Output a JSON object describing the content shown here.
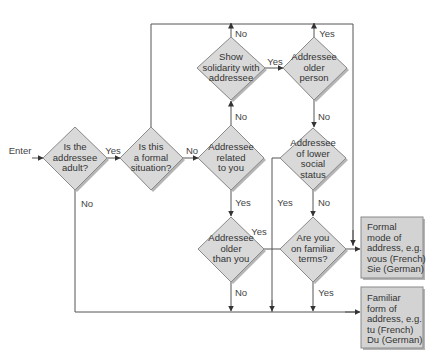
{
  "colors": {
    "diamond_fill": "#d9d9d9",
    "diamond_stroke": "#8a8a8a",
    "box_fill": "#d3d3d3",
    "box_stroke": "#8a8a8a",
    "line": "#555555",
    "shadow": "#b5b5b5",
    "text": "#333333"
  },
  "entry_label": "Enter",
  "decisions": [
    {
      "id": "adult",
      "lines": [
        "Is the",
        "addressee",
        "adult?"
      ]
    },
    {
      "id": "formal",
      "lines": [
        "Is this",
        "a formal",
        "situation?"
      ]
    },
    {
      "id": "related",
      "lines": [
        "Addressee",
        "related",
        "to you"
      ]
    },
    {
      "id": "solidarity",
      "lines": [
        "Show",
        "solidarity with",
        "addressee"
      ]
    },
    {
      "id": "older_person",
      "lines": [
        "Addressee",
        "older",
        "person"
      ]
    },
    {
      "id": "lower_status",
      "lines": [
        "Addressee",
        "of lower",
        "social",
        "status"
      ]
    },
    {
      "id": "older_than_you",
      "lines": [
        "Addressee",
        "older",
        "than you"
      ]
    },
    {
      "id": "familiar_terms",
      "lines": [
        "Are you",
        "on familiar",
        "terms?"
      ]
    }
  ],
  "outcomes": [
    {
      "id": "formal_mode",
      "lines": [
        "Formal",
        "mode of",
        "address, e.g.",
        "vous (French)",
        "Sie (German)"
      ]
    },
    {
      "id": "familiar_form",
      "lines": [
        "Familiar",
        "form of",
        "address, e.g.",
        "tu (French)",
        "Du (German)"
      ]
    }
  ],
  "edge_labels": {
    "adult_yes": "Yes",
    "adult_no": "No",
    "formal_no": "No",
    "related_no": "No",
    "related_yes": "Yes",
    "solidarity_no": "No",
    "solidarity_yes": "Yes",
    "older_person_yes": "Yes",
    "older_person_no": "No",
    "lower_status_yes": "Yes",
    "lower_status_no": "No",
    "older_than_you_yes": "Yes",
    "older_than_you_no": "No",
    "familiar_terms_yes": "Yes"
  }
}
